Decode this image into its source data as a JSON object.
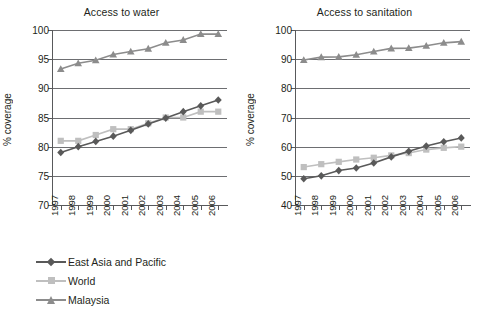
{
  "chart_data": [
    {
      "type": "line",
      "title": "Access to water",
      "xlabel": "",
      "ylabel": "% coverage",
      "x": [
        "1997",
        "1998",
        "1999",
        "2000",
        "2001",
        "2002",
        "2003",
        "2004",
        "2005",
        "2006"
      ],
      "ylim": [
        70,
        100
      ],
      "yticks": [
        70,
        75,
        80,
        85,
        90,
        95,
        100
      ],
      "grid": true,
      "legend_position": "below",
      "series": [
        {
          "name": "East Asia and Pacific",
          "values": [
            79.0,
            80.0,
            80.9,
            81.8,
            82.8,
            83.9,
            84.9,
            86.0,
            87.0,
            88.0
          ]
        },
        {
          "name": "World",
          "values": [
            81.0,
            81.0,
            82.0,
            83.0,
            83.0,
            84.0,
            85.0,
            85.0,
            86.0,
            86.0
          ]
        },
        {
          "name": "Malaysia",
          "values": [
            93.3,
            94.3,
            94.8,
            95.8,
            96.3,
            96.8,
            97.8,
            98.3,
            99.3,
            99.3
          ]
        }
      ]
    },
    {
      "type": "line",
      "title": "Access to sanitation",
      "xlabel": "",
      "ylabel": "% coverage",
      "x": [
        "1997",
        "1998",
        "1999",
        "2000",
        "2001",
        "2002",
        "2003",
        "2004",
        "2005",
        "2006"
      ],
      "ylim": [
        40,
        100
      ],
      "yticks": [
        40,
        50,
        60,
        70,
        80,
        90,
        100
      ],
      "grid": true,
      "legend_position": "below",
      "series": [
        {
          "name": "East Asia and Pacific",
          "values": [
            49.0,
            50.0,
            51.8,
            52.7,
            54.4,
            56.5,
            58.4,
            60.2,
            61.7,
            63.0
          ]
        },
        {
          "name": "World",
          "values": [
            53.0,
            54.0,
            54.8,
            55.6,
            56.2,
            57.0,
            57.8,
            59.0,
            59.6,
            60.0
          ]
        },
        {
          "name": "Malaysia",
          "values": [
            89.7,
            90.7,
            90.8,
            91.5,
            92.6,
            93.7,
            93.8,
            94.6,
            95.6,
            96.0
          ]
        }
      ]
    }
  ],
  "panels": {
    "water": {
      "title": "Access to water",
      "ylabel": "% coverage",
      "yticks": [
        "100",
        "95",
        "90",
        "85",
        "80",
        "75",
        "70"
      ],
      "xticks": [
        "1997",
        "1998",
        "1999",
        "2000",
        "2001",
        "2002",
        "2003",
        "2004",
        "2005",
        "2006"
      ]
    },
    "sanitation": {
      "title": "Access to sanitation",
      "ylabel": "% coverage",
      "yticks": [
        "100",
        "90",
        "80",
        "70",
        "60",
        "50",
        "40"
      ],
      "xticks": [
        "1997",
        "1998",
        "1999",
        "2000",
        "2001",
        "2002",
        "2003",
        "2004",
        "2005",
        "2006"
      ]
    }
  },
  "legend": {
    "items": [
      {
        "label": "East Asia and Pacific",
        "marker": "diamond",
        "color": "#595959"
      },
      {
        "label": "World",
        "marker": "square",
        "color": "#bfbfbf"
      },
      {
        "label": "Malaysia",
        "marker": "triangle",
        "color": "#8c8c8c"
      }
    ]
  },
  "colors": {
    "east_asia_and_pacific": "#595959",
    "world": "#bfbfbf",
    "malaysia": "#8c8c8c",
    "axis": "#58595b",
    "grid": "#6d6e71",
    "text": "#231f20"
  }
}
